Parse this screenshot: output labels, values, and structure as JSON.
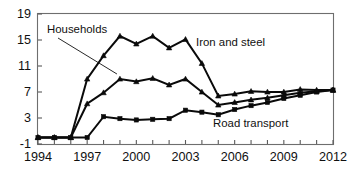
{
  "chart_data": {
    "type": "line",
    "title": "",
    "subtitle": "",
    "xlabel": "",
    "ylabel": "",
    "grid": false,
    "legend_position": "inline-annotations",
    "xlim": [
      1994,
      2012
    ],
    "ylim": [
      -1,
      19
    ],
    "x": [
      1994,
      1995,
      1996,
      1997,
      1998,
      1999,
      2000,
      2001,
      2002,
      2003,
      2004,
      2005,
      2006,
      2007,
      2008,
      2009,
      2010,
      2011,
      2012
    ],
    "xtick_values": [
      1994,
      1997,
      2000,
      2003,
      2006,
      2009,
      2012
    ],
    "xtick_labels": [
      "1994",
      "1997",
      "2000",
      "2003",
      "2006",
      "2009",
      "2012"
    ],
    "ytick_values": [
      -1,
      3,
      7,
      11,
      15,
      19
    ],
    "ytick_labels": [
      "-1",
      "3",
      "7",
      "11",
      "15",
      "19"
    ],
    "series": [
      {
        "name": "Iron and steel",
        "marker": "triangle",
        "values": [
          0,
          0,
          0,
          9.0,
          12.6,
          15.6,
          14.4,
          15.6,
          13.8,
          15.1,
          11.4,
          6.4,
          6.7,
          7.1,
          7.0,
          7.0,
          7.4,
          7.3,
          7.3
        ]
      },
      {
        "name": "Households",
        "marker": "triangle",
        "values": [
          0,
          0,
          0,
          5.2,
          6.9,
          9.0,
          8.6,
          9.1,
          8.1,
          9.0,
          7.0,
          5.0,
          5.4,
          5.8,
          6.1,
          6.5,
          6.9,
          7.1,
          7.3
        ]
      },
      {
        "name": "Road transport",
        "marker": "square",
        "values": [
          0,
          0,
          0,
          0,
          3.2,
          2.9,
          2.7,
          2.8,
          2.9,
          4.2,
          3.9,
          3.5,
          4.3,
          4.9,
          5.4,
          6.0,
          6.5,
          7.0,
          7.3
        ]
      }
    ],
    "annotations": [
      {
        "text": "Households",
        "points_to_series": "Households",
        "points_to_x": 1999
      },
      {
        "text": "Iron and steel",
        "points_to_series": "Iron and steel"
      },
      {
        "text": "Road transport",
        "points_to_series": "Road transport"
      }
    ],
    "colors": {
      "line": "#0a0a0a",
      "frame": "#6e6e6e",
      "text": "#101010",
      "background": "#ffffff"
    }
  }
}
